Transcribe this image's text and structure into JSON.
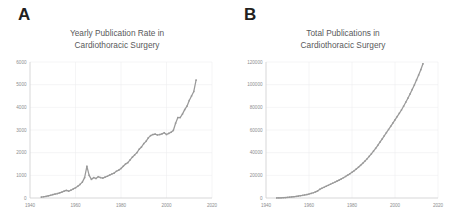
{
  "figure": {
    "background": "#ffffff",
    "series_color": "#9a9a9a",
    "grid_color": "#ececee",
    "axis_color": "#c9c9cb",
    "tick_label_color": "#8d8d8f",
    "title_color": "#59595b"
  },
  "panels": [
    {
      "letter": "A",
      "title_line1": "Yearly Publication Rate in",
      "title_line2": "Cardiothoracic Surgery"
    },
    {
      "letter": "B",
      "title_line1": "Total Publications in",
      "title_line2": "Cardiothoracic Surgery"
    }
  ],
  "chart_data": [
    {
      "type": "line",
      "title": "Yearly Publication Rate in Cardiothoracic Surgery",
      "panel_letter": "A",
      "xlabel": "",
      "ylabel": "",
      "grid": true,
      "legend": "none",
      "marker": "small-square",
      "xlim": [
        1940,
        2020
      ],
      "ylim": [
        0,
        6000
      ],
      "xticks": [
        1940,
        1960,
        1980,
        2000,
        2020
      ],
      "xtick_labels": [
        "1940",
        "1960",
        "1980",
        "2000",
        "2020"
      ],
      "yticks": [
        0,
        1000,
        2000,
        3000,
        4000,
        5000,
        6000
      ],
      "ytick_labels": [
        "0",
        "1000",
        "2000",
        "3000",
        "4000",
        "5000",
        "6000"
      ],
      "x": [
        1945,
        1946,
        1947,
        1948,
        1949,
        1950,
        1951,
        1952,
        1953,
        1954,
        1955,
        1956,
        1957,
        1958,
        1959,
        1960,
        1961,
        1962,
        1963,
        1964,
        1965,
        1966,
        1967,
        1968,
        1969,
        1970,
        1971,
        1972,
        1973,
        1974,
        1975,
        1976,
        1977,
        1978,
        1979,
        1980,
        1981,
        1982,
        1983,
        1984,
        1985,
        1986,
        1987,
        1988,
        1989,
        1990,
        1991,
        1992,
        1993,
        1994,
        1995,
        1996,
        1997,
        1998,
        1999,
        2000,
        2001,
        2002,
        2003,
        2004,
        2005,
        2006,
        2007,
        2008,
        2009,
        2010,
        2011,
        2012,
        2013
      ],
      "values": [
        40,
        55,
        70,
        95,
        120,
        150,
        175,
        195,
        225,
        260,
        300,
        335,
        300,
        345,
        400,
        450,
        520,
        600,
        700,
        900,
        1400,
        1000,
        820,
        900,
        860,
        940,
        900,
        880,
        920,
        960,
        1010,
        1060,
        1100,
        1180,
        1230,
        1300,
        1400,
        1500,
        1560,
        1680,
        1800,
        1900,
        2000,
        2150,
        2250,
        2400,
        2500,
        2650,
        2750,
        2800,
        2820,
        2780,
        2800,
        2830,
        2880,
        2800,
        2850,
        2900,
        2980,
        3300,
        3550,
        3550,
        3700,
        3900,
        4050,
        4300,
        4500,
        4700,
        5200
      ]
    },
    {
      "type": "line",
      "title": "Total Publications in Cardiothoracic Surgery",
      "panel_letter": "B",
      "xlabel": "",
      "ylabel": "",
      "grid": true,
      "legend": "none",
      "marker": "small-square",
      "xlim": [
        1940,
        2020
      ],
      "ylim": [
        0,
        120000
      ],
      "xticks": [
        1940,
        1960,
        1980,
        2000,
        2020
      ],
      "xtick_labels": [
        "1940",
        "1960",
        "1980",
        "2000",
        "2020"
      ],
      "yticks": [
        0,
        20000,
        40000,
        60000,
        80000,
        100000,
        120000
      ],
      "ytick_labels": [
        "0",
        "20000",
        "40000",
        "60000",
        "80000",
        "100000",
        "120000"
      ],
      "x": [
        1945,
        1946,
        1947,
        1948,
        1949,
        1950,
        1951,
        1952,
        1953,
        1954,
        1955,
        1956,
        1957,
        1958,
        1959,
        1960,
        1961,
        1962,
        1963,
        1964,
        1965,
        1966,
        1967,
        1968,
        1969,
        1970,
        1971,
        1972,
        1973,
        1974,
        1975,
        1976,
        1977,
        1978,
        1979,
        1980,
        1981,
        1982,
        1983,
        1984,
        1985,
        1986,
        1987,
        1988,
        1989,
        1990,
        1991,
        1992,
        1993,
        1994,
        1995,
        1996,
        1997,
        1998,
        1999,
        2000,
        2001,
        2002,
        2003,
        2004,
        2005,
        2006,
        2007,
        2008,
        2009,
        2010,
        2011,
        2012,
        2013
      ],
      "values": [
        40,
        95,
        165,
        260,
        380,
        530,
        705,
        900,
        1125,
        1385,
        1685,
        2020,
        2320,
        2665,
        3065,
        3515,
        4035,
        4635,
        5335,
        6235,
        7635,
        8635,
        9455,
        10355,
        11215,
        12155,
        13055,
        13935,
        14855,
        15815,
        16825,
        17885,
        18985,
        20165,
        21395,
        22695,
        24095,
        25595,
        27155,
        28835,
        30635,
        32535,
        34535,
        36685,
        38935,
        41335,
        43835,
        46485,
        49235,
        52035,
        54855,
        57635,
        60435,
        63265,
        66145,
        68945,
        71795,
        74695,
        77675,
        80975,
        84525,
        88075,
        91775,
        95675,
        99725,
        104025,
        108525,
        113225,
        118425
      ]
    }
  ]
}
